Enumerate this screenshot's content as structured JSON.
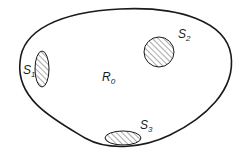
{
  "diagram": {
    "type": "region-with-subregions",
    "outer_region": {
      "label": "R",
      "subscript": "0"
    },
    "subregions": [
      {
        "id": "S1",
        "label": "S",
        "subscript": "1",
        "shape": "vertical-ellipse",
        "fill": "hatched"
      },
      {
        "id": "S2",
        "label": "S",
        "subscript": "2",
        "shape": "circle",
        "fill": "hatched"
      },
      {
        "id": "S3",
        "label": "S",
        "subscript": "3",
        "shape": "horizontal-ellipse",
        "fill": "hatched"
      }
    ],
    "colors": {
      "stroke": "#1a1a1a",
      "background": "#ffffff",
      "hatch": "#555555"
    }
  }
}
